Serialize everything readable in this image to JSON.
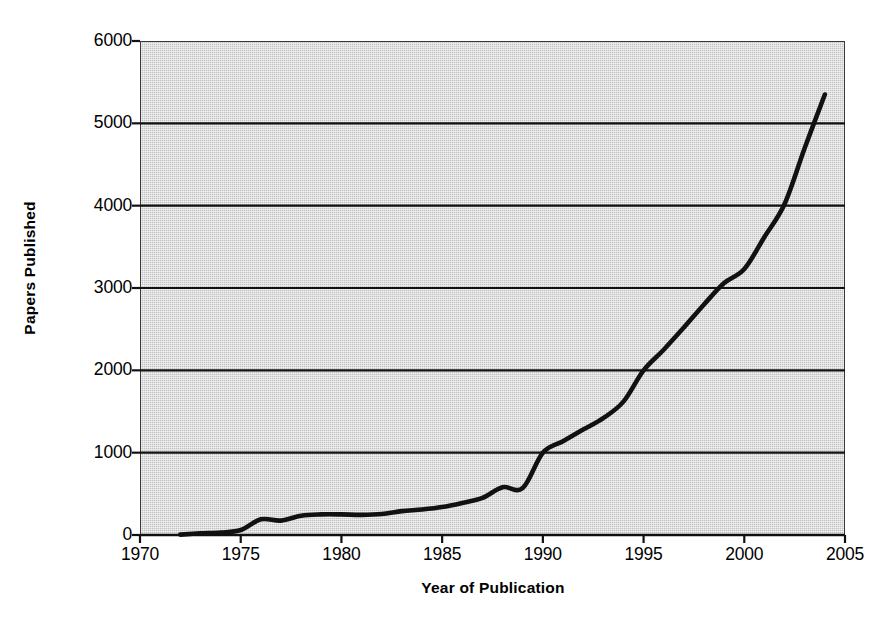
{
  "chart_data": {
    "type": "line",
    "title": "",
    "xlabel": "Year of Publication",
    "ylabel": "Papers Published",
    "xlim": [
      1970,
      2005
    ],
    "ylim": [
      0,
      6000
    ],
    "grid": "horizontal",
    "legend": "none",
    "xticks": [
      1970,
      1975,
      1980,
      1985,
      1990,
      1995,
      2000,
      2005
    ],
    "yticks": [
      0,
      1000,
      2000,
      3000,
      4000,
      5000,
      6000
    ],
    "xtick_labels": [
      "1970",
      "1975",
      "1980",
      "1985",
      "1990",
      "1995",
      "2000",
      "2005"
    ],
    "ytick_labels": [
      "0",
      "1000",
      "2000",
      "3000",
      "4000",
      "5000",
      "6000"
    ],
    "series": [
      {
        "name": "Papers Published",
        "color": "#111111",
        "x": [
          1972,
          1973,
          1974,
          1975,
          1976,
          1977,
          1978,
          1979,
          1980,
          1981,
          1982,
          1983,
          1984,
          1985,
          1986,
          1987,
          1988,
          1989,
          1990,
          1991,
          1992,
          1993,
          1994,
          1995,
          1996,
          1997,
          1998,
          1999,
          2000,
          2001,
          2002,
          2003,
          2004
        ],
        "values": [
          5,
          20,
          30,
          60,
          190,
          175,
          235,
          250,
          250,
          245,
          255,
          290,
          310,
          340,
          390,
          450,
          580,
          570,
          1000,
          1140,
          1280,
          1420,
          1620,
          2000,
          2250,
          2520,
          2800,
          3060,
          3230,
          3620,
          4020,
          4700,
          5350
        ]
      }
    ]
  },
  "axes": {
    "ylabel": "Papers Published",
    "xlabel": "Year of Publication"
  },
  "colors": {
    "panel_fill": "#c3c3c3",
    "panel_border": "#3a3a3a",
    "gridline": "#111111",
    "series_line": "#111111",
    "page_background": "#ffffff",
    "text": "#000000"
  }
}
